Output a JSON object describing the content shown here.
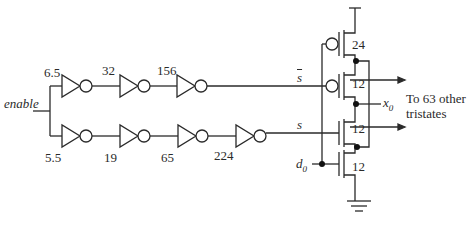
{
  "diagram": {
    "input_label": "enable",
    "top_chain": {
      "inverter_sizes": [
        "6.5",
        "32",
        "156"
      ],
      "output_label": "s"
    },
    "bottom_chain": {
      "inverter_sizes": [
        "5.5",
        "19",
        "65",
        "224"
      ],
      "output_label": "s"
    },
    "data_input_label": "d",
    "data_input_subscript": "0",
    "tristate": {
      "pmos_top_size": "24",
      "pmos_enable_size": "12",
      "nmos_enable_size": "12",
      "nmos_bottom_size": "12",
      "output_label": "x",
      "output_subscript": "0"
    },
    "fanout_label_line1": "To 63 other",
    "fanout_label_line2": "tristates"
  }
}
